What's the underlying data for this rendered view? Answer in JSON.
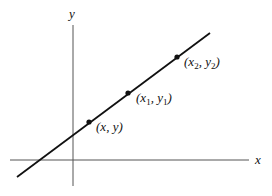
{
  "diagram": {
    "axes": {
      "x_label": "x",
      "y_label": "y",
      "axis_color": "#555555"
    },
    "line": {
      "color": "#111111",
      "from": [
        17,
        177
      ],
      "to": [
        210,
        33
      ]
    },
    "points": [
      {
        "id": "p",
        "label": "(x, y)",
        "var_x": "x",
        "var_y": "y",
        "sub": ""
      },
      {
        "id": "p1",
        "label": "(x1, y1)",
        "var_x": "x",
        "var_y": "y",
        "sub": "1"
      },
      {
        "id": "p2",
        "label": "(x2, y2)",
        "var_x": "x",
        "var_y": "y",
        "sub": "2"
      }
    ],
    "text": {
      "open_paren": "(",
      "comma": ", ",
      "close_paren": ")"
    }
  }
}
